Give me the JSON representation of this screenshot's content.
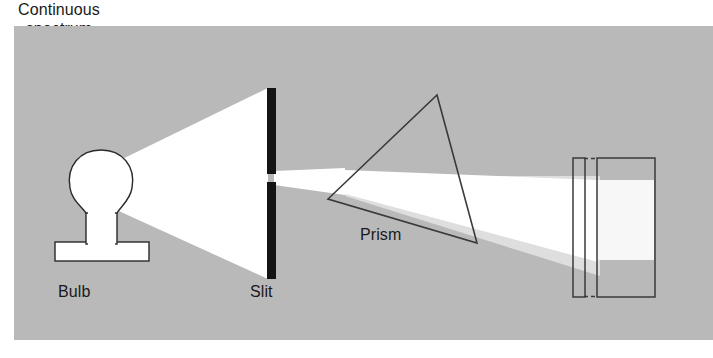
{
  "diagram": {
    "type": "optics-ray-diagram",
    "canvas": {
      "width": 713,
      "height": 358
    },
    "background": {
      "page_color": "#ffffff",
      "panel_color": "#b9b9b9",
      "panel_rect": {
        "x": 14,
        "y": 26,
        "width": 699,
        "height": 314
      }
    },
    "colors": {
      "panel_gray": "#b9b9b9",
      "beam_white": "#ffffff",
      "beam_dim": "#dedede",
      "outline": "#2a2a2a",
      "text": "#1a1a1a",
      "spectrum_band": "#f7f7f7"
    },
    "labels": {
      "bulb": "Bulb",
      "slit": "Slit",
      "prism": "Prism",
      "spectrum_line1": "Continuous",
      "spectrum_line2": "spectrum"
    },
    "components": [
      {
        "name": "bulb",
        "label": "Bulb",
        "description": "Incandescent light source, white glass envelope with base and flat foot",
        "envelope_center": {
          "x": 101,
          "y": 183
        },
        "envelope_radius": 31,
        "base_rect": {
          "x": 86,
          "y": 212,
          "width": 31,
          "height": 30
        },
        "foot_rect": {
          "x": 55,
          "y": 242,
          "width": 94,
          "height": 19
        }
      },
      {
        "name": "slit",
        "label": "Slit",
        "description": "Opaque barrier formed by two black bars with a narrow horizontal gap",
        "upper_bar": {
          "x": 267,
          "y": 88,
          "width": 9,
          "height": 86
        },
        "lower_bar": {
          "x": 267,
          "y": 182,
          "width": 9,
          "height": 97
        },
        "gap": {
          "y_top": 174,
          "y_bottom": 182
        }
      },
      {
        "name": "prism",
        "label": "Prism",
        "description": "Triangular glass prism outline, apex up, tilted",
        "vertices": [
          {
            "x": 437,
            "y": 95
          },
          {
            "x": 477,
            "y": 243
          },
          {
            "x": 328,
            "y": 199
          }
        ]
      },
      {
        "name": "screen",
        "label": "Continuous spectrum",
        "description": "Viewing screen drawn in perspective: thin edge-on sliver on the left joined by dashed lines to the broad face on the right, bright continuous band displayed on the face",
        "edge_sliver": {
          "x": 573,
          "y": 158,
          "width": 12,
          "height": 139
        },
        "face_rect": {
          "x": 597,
          "y": 158,
          "width": 58,
          "height": 139
        },
        "band_rect": {
          "x": 597,
          "y": 180,
          "width": 58,
          "height": 80
        },
        "dashed_connectors": [
          {
            "x1": 585,
            "y1": 158,
            "x2": 597,
            "y2": 158
          },
          {
            "x1": 585,
            "y1": 297,
            "x2": 597,
            "y2": 297
          }
        ]
      }
    ],
    "light_path": [
      {
        "name": "source-cone",
        "description": "Diverging white cone from bulb filament widening to fill the slit barrier",
        "points": "110,165 110,207 268,279 268,88"
      },
      {
        "name": "collimated-beam",
        "description": "Narrow white beam passing through the slit aperture toward the prism",
        "points": "276,172 276,184 340,193 340,170"
      },
      {
        "name": "dispersed-fan",
        "description": "Refracted beam leaving the prism, bent downward and spreading into a fan that lands on the screen",
        "points": "340,170 340,193 597,262 597,180"
      }
    ]
  }
}
